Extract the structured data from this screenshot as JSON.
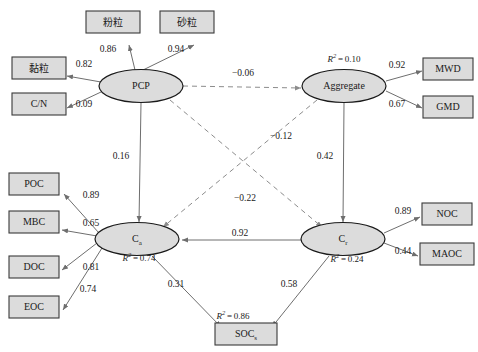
{
  "diagram": {
    "type": "structural-equation-model-path-diagram",
    "canvas": {
      "width": 478,
      "height": 352
    },
    "nodes": {
      "silt": {
        "label": "粉粒",
        "shape": "rect",
        "x": 113,
        "y": 22,
        "w": 54,
        "h": 22
      },
      "sand": {
        "label": "砂粒",
        "shape": "rect",
        "x": 187,
        "y": 22,
        "w": 54,
        "h": 22
      },
      "clay": {
        "label": "黏粒",
        "shape": "rect",
        "x": 39,
        "y": 68,
        "w": 54,
        "h": 22
      },
      "cn": {
        "label": "C/N",
        "shape": "rect",
        "x": 39,
        "y": 104,
        "w": 54,
        "h": 22
      },
      "pcp": {
        "label": "PCP",
        "shape": "ellipse",
        "x": 141,
        "y": 86,
        "w": 84,
        "h": 33
      },
      "aggregate": {
        "label": "Aggregate",
        "shape": "ellipse",
        "x": 344,
        "y": 86,
        "w": 84,
        "h": 33
      },
      "mwd": {
        "label": "MWD",
        "shape": "rect",
        "x": 448,
        "y": 69,
        "w": 50,
        "h": 22
      },
      "gmd": {
        "label": "GMD",
        "shape": "rect",
        "x": 448,
        "y": 107,
        "w": 50,
        "h": 22
      },
      "poc": {
        "label": "POC",
        "shape": "rect",
        "x": 34,
        "y": 184,
        "w": 50,
        "h": 22
      },
      "mbc": {
        "label": "MBC",
        "shape": "rect",
        "x": 34,
        "y": 222,
        "w": 50,
        "h": 22
      },
      "doc": {
        "label": "DOC",
        "shape": "rect",
        "x": 34,
        "y": 267,
        "w": 50,
        "h": 22
      },
      "eoc": {
        "label": "EOC",
        "shape": "rect",
        "x": 34,
        "y": 307,
        "w": 50,
        "h": 22
      },
      "ca": {
        "label": "C",
        "sub": "a",
        "shape": "ellipse",
        "x": 137,
        "y": 239,
        "w": 84,
        "h": 33
      },
      "cr": {
        "label": "C",
        "sub": "r",
        "shape": "ellipse",
        "x": 343,
        "y": 239,
        "w": 84,
        "h": 33
      },
      "noc": {
        "label": "NOC",
        "shape": "rect",
        "x": 447,
        "y": 214,
        "w": 50,
        "h": 22
      },
      "maoc": {
        "label": "MAOC",
        "shape": "rect",
        "x": 447,
        "y": 254,
        "w": 54,
        "h": 22
      },
      "socs": {
        "label": "SOC",
        "sub": "s",
        "shape": "rect",
        "x": 246,
        "y": 334,
        "w": 62,
        "h": 22
      }
    },
    "r_squared": [
      {
        "node": "aggregate",
        "value": "0.10",
        "x": 344,
        "y": 60
      },
      {
        "node": "ca",
        "value": "0.74",
        "x": 139,
        "y": 259
      },
      {
        "node": "cr",
        "value": "0.24",
        "x": 347,
        "y": 260
      },
      {
        "node": "socs",
        "value": "0.86",
        "x": 233,
        "y": 317
      }
    ],
    "edges": [
      {
        "from": "pcp",
        "to": "silt",
        "coef": "0.86",
        "style": "solid",
        "label_x": 108,
        "label_y": 50,
        "x1": 135,
        "y1": 70,
        "x2": 129,
        "y2": 45
      },
      {
        "from": "pcp",
        "to": "sand",
        "coef": "0.94",
        "style": "solid",
        "label_x": 176,
        "label_y": 50,
        "x1": 143,
        "y1": 70,
        "x2": 194,
        "y2": 45
      },
      {
        "from": "pcp",
        "to": "clay",
        "coef": "0.82",
        "style": "solid",
        "label_x": 84,
        "label_y": 65,
        "x1": 101,
        "y1": 82,
        "x2": 67,
        "y2": 76
      },
      {
        "from": "pcp",
        "to": "cn",
        "coef": "0.09",
        "style": "solid",
        "label_x": 84,
        "label_y": 105,
        "x1": 101,
        "y1": 92,
        "x2": 67,
        "y2": 108
      },
      {
        "from": "pcp",
        "to": "aggregate",
        "coef": "−0.06",
        "style": "dashed",
        "label_x": 243,
        "label_y": 74,
        "x1": 183,
        "y1": 86,
        "x2": 301,
        "y2": 88
      },
      {
        "from": "pcp",
        "to": "ca",
        "coef": "0.16",
        "style": "solid",
        "label_x": 121,
        "label_y": 157,
        "x1": 141,
        "y1": 103,
        "x2": 139,
        "y2": 222
      },
      {
        "from": "pcp",
        "to": "cr",
        "coef": "−0.12",
        "style": "dashed",
        "label_x": 281,
        "label_y": 137,
        "x1": 170,
        "y1": 100,
        "x2": 322,
        "y2": 227
      },
      {
        "from": "aggregate",
        "to": "mwd",
        "coef": "0.92",
        "style": "solid",
        "label_x": 397,
        "label_y": 66,
        "x1": 386,
        "y1": 81,
        "x2": 422,
        "y2": 71
      },
      {
        "from": "aggregate",
        "to": "gmd",
        "coef": "0.67",
        "style": "solid",
        "label_x": 397,
        "label_y": 105,
        "x1": 386,
        "y1": 91,
        "x2": 422,
        "y2": 108
      },
      {
        "from": "aggregate",
        "to": "cr",
        "coef": "0.42",
        "style": "solid",
        "label_x": 325,
        "label_y": 157,
        "x1": 344,
        "y1": 103,
        "x2": 343,
        "y2": 222
      },
      {
        "from": "aggregate",
        "to": "ca",
        "coef": "−0.22",
        "style": "dashed",
        "label_x": 245,
        "label_y": 199,
        "x1": 317,
        "y1": 100,
        "x2": 163,
        "y2": 227
      },
      {
        "from": "ca",
        "to": "poc",
        "coef": "0.89",
        "style": "solid",
        "label_x": 91,
        "label_y": 196,
        "x1": 99,
        "y1": 233,
        "x2": 64,
        "y2": 194
      },
      {
        "from": "ca",
        "to": "mbc",
        "coef": "0.65",
        "style": "solid",
        "label_x": 91,
        "label_y": 224,
        "x1": 97,
        "y1": 236,
        "x2": 62,
        "y2": 230
      },
      {
        "from": "ca",
        "to": "doc",
        "coef": "0.81",
        "style": "solid",
        "label_x": 91,
        "label_y": 268,
        "x1": 97,
        "y1": 243,
        "x2": 62,
        "y2": 270
      },
      {
        "from": "ca",
        "to": "eoc",
        "coef": "0.74",
        "style": "solid",
        "label_x": 88,
        "label_y": 290,
        "x1": 102,
        "y1": 248,
        "x2": 63,
        "y2": 310
      },
      {
        "from": "cr",
        "to": "ca",
        "coef": "0.92",
        "style": "solid",
        "label_x": 240,
        "label_y": 234,
        "x1": 301,
        "y1": 240,
        "x2": 182,
        "y2": 240
      },
      {
        "from": "cr",
        "to": "noc",
        "coef": "0.89",
        "style": "solid",
        "label_x": 403,
        "label_y": 212,
        "x1": 384,
        "y1": 233,
        "x2": 420,
        "y2": 217
      },
      {
        "from": "cr",
        "to": "maoc",
        "coef": "0.44",
        "style": "solid",
        "label_x": 403,
        "label_y": 252,
        "x1": 384,
        "y1": 243,
        "x2": 418,
        "y2": 256
      },
      {
        "from": "ca",
        "to": "socs",
        "coef": "0.31",
        "style": "solid",
        "label_x": 176,
        "label_y": 285,
        "x1": 152,
        "y1": 256,
        "x2": 221,
        "y2": 327
      },
      {
        "from": "cr",
        "to": "socs",
        "coef": "0.58",
        "style": "solid",
        "label_x": 289,
        "label_y": 285,
        "x1": 329,
        "y1": 256,
        "x2": 272,
        "y2": 327
      }
    ]
  },
  "legend": {
    "solid_meaning": "positive path",
    "dashed_meaning": "negative path"
  }
}
